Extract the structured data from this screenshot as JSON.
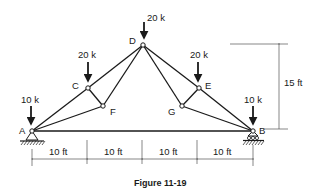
{
  "figure": {
    "caption": "Figure 11-19",
    "nodes": {
      "A": {
        "label": "A",
        "x": 32,
        "y": 131
      },
      "B": {
        "label": "B",
        "x": 253,
        "y": 131
      },
      "C": {
        "label": "C",
        "x": 88,
        "y": 88
      },
      "D": {
        "label": "D",
        "x": 143,
        "y": 45
      },
      "E": {
        "label": "E",
        "x": 199,
        "y": 88
      },
      "F": {
        "label": "F",
        "x": 103,
        "y": 106
      },
      "G": {
        "label": "G",
        "x": 182,
        "y": 106
      }
    },
    "members": [
      [
        "A",
        "B"
      ],
      [
        "A",
        "C"
      ],
      [
        "C",
        "D"
      ],
      [
        "D",
        "E"
      ],
      [
        "E",
        "B"
      ],
      [
        "A",
        "F"
      ],
      [
        "F",
        "D"
      ],
      [
        "D",
        "G"
      ],
      [
        "G",
        "B"
      ],
      [
        "C",
        "F"
      ],
      [
        "E",
        "G"
      ]
    ],
    "loads": {
      "A": "10 k",
      "C": "20 k",
      "D": "20 k",
      "E": "20 k",
      "B": "10 k"
    },
    "supports": {
      "A": "pin",
      "B": "roller"
    },
    "dimensions": {
      "spans": [
        "10 ft",
        "10 ft",
        "10 ft",
        "10 ft"
      ],
      "height": "15 ft"
    }
  }
}
